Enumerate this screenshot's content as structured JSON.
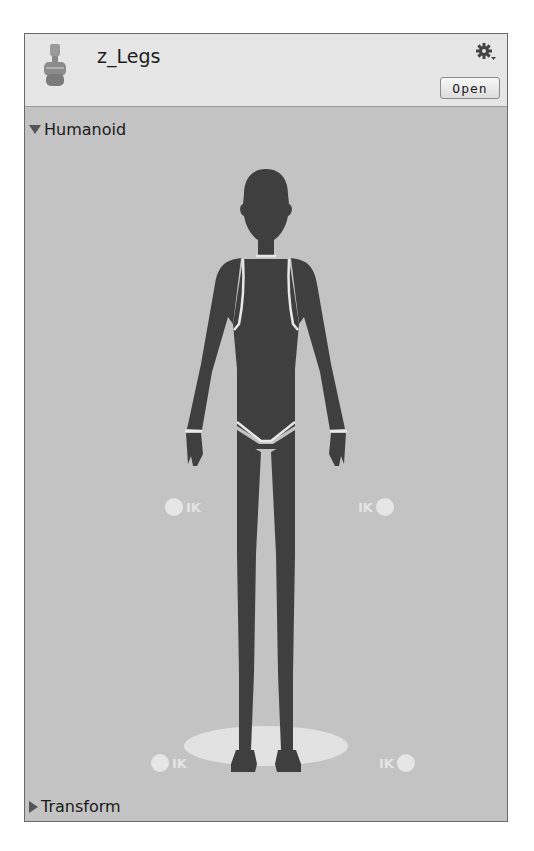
{
  "header": {
    "title": "z_Legs",
    "asset_icon": "humanoid-avatar-icon",
    "settings_icon": "gear-icon",
    "open_label": "Open"
  },
  "sections": {
    "humanoid": {
      "label": "Humanoid",
      "expanded": true
    },
    "transform": {
      "label": "Transform",
      "expanded": false
    }
  },
  "avatar": {
    "ik_label": "IK",
    "ik_targets": [
      "left-hand-ik",
      "right-hand-ik",
      "left-foot-ik",
      "right-foot-ik"
    ]
  },
  "colors": {
    "header_bg": "#e6e6e6",
    "body_bg": "#c3c3c3",
    "figure": "#3f3f3f",
    "outline": "#e8e8e8"
  }
}
